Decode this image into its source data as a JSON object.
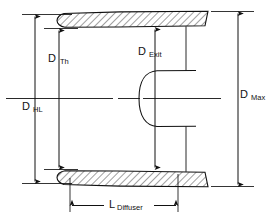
{
  "figure": {
    "type": "engineering-cross-section",
    "background_color": "#ffffff",
    "line_color": "#111111",
    "hatch_color": "#111111"
  },
  "labels": {
    "d_th": {
      "symbol": "D",
      "subscript": "Th"
    },
    "d_hl": {
      "symbol": "D",
      "subscript": "HL"
    },
    "d_exit": {
      "symbol": "D",
      "subscript": "Exit"
    },
    "d_max": {
      "symbol": "D",
      "subscript": "Max"
    },
    "l_diffuser": {
      "symbol": "L",
      "subscript": "Diffuser"
    }
  },
  "dimensions": [
    {
      "name": "D_Th",
      "orientation": "vertical",
      "arrow_ends": "both",
      "description": "Throat diameter, measured between the inner surfaces of the upper and lower bodies near the leading edge"
    },
    {
      "name": "D_HL",
      "orientation": "vertical",
      "arrow_ends": "both",
      "description": "Highlight diameter, measured between the leading-edge tips of the upper and lower bodies"
    },
    {
      "name": "D_Exit",
      "orientation": "vertical",
      "arrow_ends": "both",
      "description": "Exit diameter, measured between the inner surfaces at the diffuser exit station"
    },
    {
      "name": "D_Max",
      "orientation": "vertical",
      "arrow_ends": "both",
      "description": "Maximum outer diameter, measured between the outer surfaces of the upper and lower bodies at the trailing edge"
    },
    {
      "name": "L_Diffuser",
      "orientation": "horizontal",
      "arrow_ends": "both",
      "description": "Axial length of the diffuser, from the leading edge station to the exit station"
    }
  ],
  "components": {
    "upper_body": "Hatched tapered cowl wall, rounded leading edge at left, section hatching at 45 degrees",
    "lower_body": "Hatched tapered cowl wall mirroring the upper body about the centerline",
    "centerbody": "U-shaped plug profile opening toward the left, located on the centerline",
    "centerline": "Horizontal axis-of-symmetry line spanning the full figure width"
  }
}
